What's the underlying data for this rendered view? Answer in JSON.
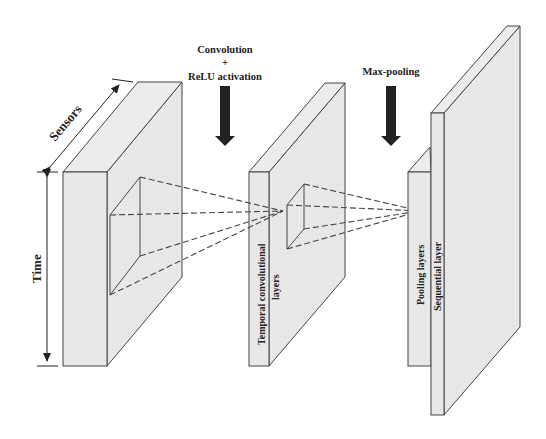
{
  "diagram": {
    "type": "cnn-architecture",
    "labels": {
      "sensors": "Sensors",
      "time": "Time",
      "convolution_line1": "Convolution",
      "convolution_plus": "+",
      "convolution_line2": "ReLU activation",
      "max_pooling": "Max-pooling",
      "temporal_line1": "Temporal convolutional",
      "temporal_line2": "layers",
      "pooling": "Pooling layers",
      "sequential": "Sequential layer"
    },
    "colors": {
      "face_fill": "#e6e6e6",
      "side_fill": "#eeeeee",
      "stroke": "#444444",
      "arrow": "#222222",
      "background": "#ffffff"
    },
    "nodes": [
      {
        "id": "input",
        "label_ref": "sensors/time"
      },
      {
        "id": "temporal-conv",
        "label_ref": "temporal"
      },
      {
        "id": "pooling",
        "label_ref": "pooling"
      },
      {
        "id": "sequential",
        "label_ref": "sequential"
      }
    ],
    "operations": [
      {
        "from": "input",
        "to": "temporal-conv",
        "label_ref": "convolution"
      },
      {
        "from": "temporal-conv",
        "to": "pooling",
        "label_ref": "max_pooling"
      }
    ]
  }
}
